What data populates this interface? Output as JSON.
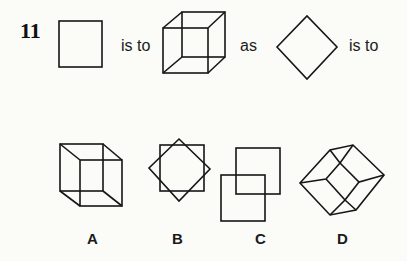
{
  "question": {
    "number": "11",
    "phrases": [
      "is to",
      "as",
      "is to"
    ],
    "stem_figures": [
      "square",
      "wireframe-cube",
      "diamond"
    ]
  },
  "options": [
    {
      "label": "A",
      "figure": "wireframe-cube-shifted-down-right"
    },
    {
      "label": "B",
      "figure": "square-overlaid-with-diamond"
    },
    {
      "label": "C",
      "figure": "two-overlapping-squares"
    },
    {
      "label": "D",
      "figure": "wireframe-cube-rotated-45deg"
    }
  ]
}
